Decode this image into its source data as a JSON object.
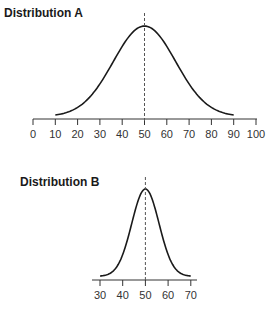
{
  "chart_data": [
    {
      "type": "line",
      "title": "Distribution A",
      "description": "Normal distribution curve, mean 50, wide spread",
      "x_ticks": [
        0,
        10,
        20,
        30,
        40,
        50,
        60,
        70,
        80,
        90,
        100
      ],
      "xlim": [
        0,
        100
      ],
      "curve_range": [
        10,
        90
      ],
      "mean": 50,
      "sd": 14,
      "mean_line": {
        "x": 50,
        "style": "dashed"
      },
      "xlabel": "",
      "ylabel": "",
      "grid": false
    },
    {
      "type": "line",
      "title": "Distribution B",
      "description": "Normal distribution curve, mean 50, narrow spread",
      "x_ticks": [
        30,
        40,
        50,
        60,
        70
      ],
      "xlim": [
        27,
        72
      ],
      "curve_range": [
        30,
        70
      ],
      "mean": 50,
      "sd": 6,
      "mean_line": {
        "x": 50,
        "style": "dashed"
      },
      "xlabel": "",
      "ylabel": "",
      "grid": false
    }
  ],
  "titles": {
    "a": "Distribution A",
    "b": "Distribution B"
  },
  "colors": {
    "curve": "#1a1a1a",
    "axis": "#333333",
    "mean_line": "#555555"
  }
}
